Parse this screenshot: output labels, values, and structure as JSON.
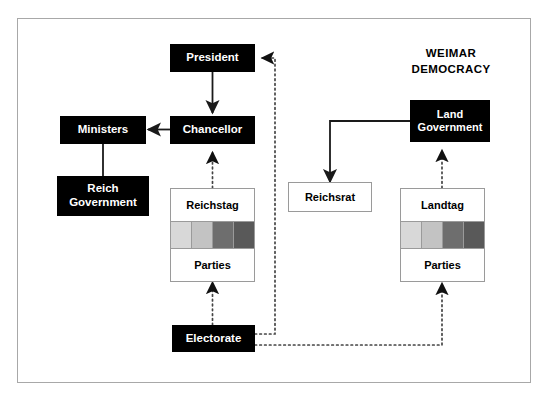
{
  "diagram": {
    "title_line1": "WEIMAR",
    "title_line2": "DEMOCRACY",
    "frame_border_color": "#a8a8a8",
    "node_fill_black": "#000000",
    "node_text_on_black": "#ffffff",
    "node_fill_white": "#ffffff",
    "node_border_white": "#9a9a9a",
    "solid_line_color": "#1a1a1a",
    "dotted_line_color": "#555555",
    "nodes": {
      "president": "President",
      "chancellor": "Chancellor",
      "ministers": "Ministers",
      "reich_government": "Reich\nGovernment",
      "reich_government_line1": "Reich",
      "reich_government_line2": "Government",
      "reichstag": "Reichstag",
      "reichstag_parties": "Parties",
      "reichsrat": "Reichsrat",
      "land_government_line1": "Land",
      "land_government_line2": "Government",
      "landtag": "Landtag",
      "landtag_parties": "Parties",
      "electorate": "Electorate"
    },
    "party_bands": {
      "reichstag": [
        "#d8d8d8",
        "#c3c3c3",
        "#6e6e6e",
        "#595959"
      ],
      "landtag": [
        "#d8d8d8",
        "#c3c3c3",
        "#6e6e6e",
        "#595959"
      ]
    },
    "connections": [
      {
        "from": "President",
        "to": "Chancellor",
        "style": "solid",
        "arrow": "to"
      },
      {
        "from": "Chancellor",
        "to": "Ministers",
        "style": "solid",
        "arrow": "to"
      },
      {
        "from": "Ministers",
        "to": "Reich Government",
        "style": "solid",
        "arrow": "none"
      },
      {
        "from": "Reichstag",
        "to": "Chancellor",
        "style": "dotted",
        "arrow": "to"
      },
      {
        "from": "Electorate",
        "to": "Reichstag",
        "style": "dotted",
        "arrow": "to"
      },
      {
        "from": "Electorate",
        "to": "President",
        "style": "dotted",
        "arrow": "to"
      },
      {
        "from": "Electorate",
        "to": "Landtag",
        "style": "dotted",
        "arrow": "to"
      },
      {
        "from": "Landtag",
        "to": "Land Government",
        "style": "dotted",
        "arrow": "to"
      },
      {
        "from": "Land Government",
        "to": "Reichsrat",
        "style": "solid",
        "arrow": "to"
      }
    ]
  }
}
